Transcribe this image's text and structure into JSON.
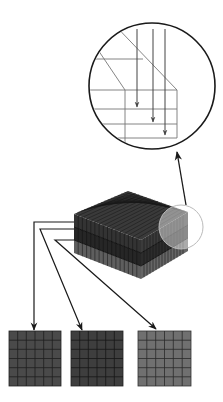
{
  "diagram": {
    "description": "Layered voxel block decomposed into three slice grids with magnified edge detail",
    "colors": {
      "background": "#ffffff",
      "line": "#1a1a1a",
      "detail_line": "#777777",
      "layer_top": "#3a3a3a",
      "layer_middle": "#2e2e2e",
      "layer_bottom": "#6a6a6a",
      "magnifier_fill": "#f2f2f2"
    },
    "magnified_view": {
      "shape": "circle",
      "center": [
        152,
        86
      ],
      "radius": 63,
      "arrow_count": 3,
      "layer_lines": 4
    },
    "block": {
      "layers": 3,
      "grid_cells_per_side": 16
    },
    "slices": [
      {
        "label": "layer-1",
        "grid": [
          6,
          6
        ],
        "color": "#4a4a4a"
      },
      {
        "label": "layer-2",
        "grid": [
          6,
          6
        ],
        "color": "#3e3e3e"
      },
      {
        "label": "layer-3",
        "grid": [
          6,
          6
        ],
        "color": "#707070"
      }
    ]
  }
}
